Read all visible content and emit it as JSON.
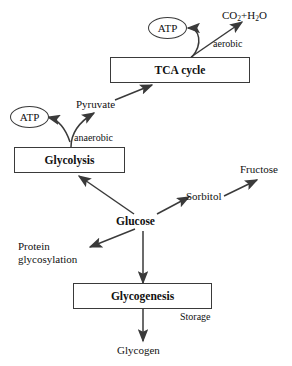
{
  "diagram": {
    "background_color": "#ffffff",
    "line_color": "#3a3a3a",
    "text_color": "#111111",
    "nodes": {
      "atp_aerobic": {
        "label": "ATP",
        "shape": "ellipse"
      },
      "atp_anaerobic": {
        "label": "ATP",
        "shape": "ellipse"
      },
      "tca_cycle": {
        "label": "TCA cycle",
        "shape": "box"
      },
      "glycolysis": {
        "label": "Glycolysis",
        "shape": "box"
      },
      "glycogenesis": {
        "label": "Glycogenesis",
        "shape": "box"
      },
      "glucose": {
        "label": "Glucose",
        "shape": "text-bold"
      },
      "pyruvate": {
        "label": "Pyruvate",
        "shape": "text"
      },
      "sorbitol": {
        "label": "Sorbitol",
        "shape": "text"
      },
      "fructose": {
        "label": "Fructose",
        "shape": "text"
      },
      "glycogen": {
        "label": "Glycogen",
        "shape": "text"
      },
      "protein_glycosylation": {
        "label": "Protein\nglycosylation",
        "shape": "text"
      },
      "co2_h2o": {
        "label": "CO2+H2O",
        "shape": "text"
      }
    },
    "edge_labels": {
      "aerobic": "aerobic",
      "anaerobic": "anaerobic",
      "storage": "Storage"
    }
  }
}
